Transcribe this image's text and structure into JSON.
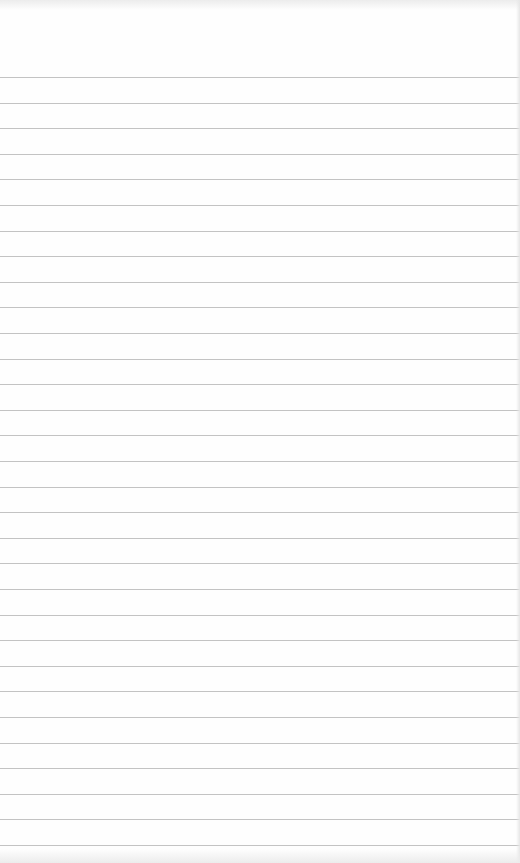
{
  "paper": {
    "type": "lined-paper",
    "background": "#fefefe",
    "rule_color": "#b9b9b9",
    "first_rule_y": 77,
    "rule_spacing": 25.6,
    "rule_count": 31
  }
}
